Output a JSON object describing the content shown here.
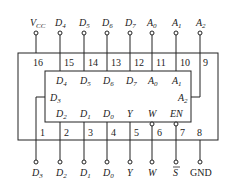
{
  "chip": {
    "top_pins": [
      {
        "num": "16",
        "label": "V",
        "sub": "CC",
        "x": 36
      },
      {
        "num": "15",
        "label": "D",
        "sub": "4",
        "x": 60
      },
      {
        "num": "14",
        "label": "D",
        "sub": "5",
        "x": 84
      },
      {
        "num": "13",
        "label": "D",
        "sub": "6",
        "x": 107
      },
      {
        "num": "12",
        "label": "D",
        "sub": "7",
        "x": 130
      },
      {
        "num": "11",
        "label": "A",
        "sub": "0",
        "x": 152
      },
      {
        "num": "10",
        "label": "A",
        "sub": "1",
        "x": 176
      },
      {
        "num": "9",
        "label": "A",
        "sub": "2",
        "x": 200
      }
    ],
    "bottom_pins": [
      {
        "num": "1",
        "label": "D",
        "sub": "3",
        "x": 36
      },
      {
        "num": "2",
        "label": "D",
        "sub": "2",
        "x": 60
      },
      {
        "num": "3",
        "label": "D",
        "sub": "1",
        "x": 84
      },
      {
        "num": "4",
        "label": "D",
        "sub": "0",
        "x": 107
      },
      {
        "num": "5",
        "label": "Y",
        "sub": "",
        "x": 130
      },
      {
        "num": "6",
        "label": "W",
        "sub": "",
        "x": 152
      },
      {
        "num": "7",
        "label": "S",
        "sub": "",
        "overline": true,
        "x": 176
      },
      {
        "num": "8",
        "label": "GND",
        "sub": "",
        "x": 200
      }
    ],
    "inner_top_labels": [
      "D4",
      "D5",
      "D6",
      "D7",
      "A0",
      "A1"
    ],
    "inner_bottom_labels": [
      "D2",
      "D1",
      "D0",
      "Y",
      "W",
      "EN"
    ],
    "inner_side_labels": {
      "left": "D3",
      "right": "A2"
    }
  }
}
